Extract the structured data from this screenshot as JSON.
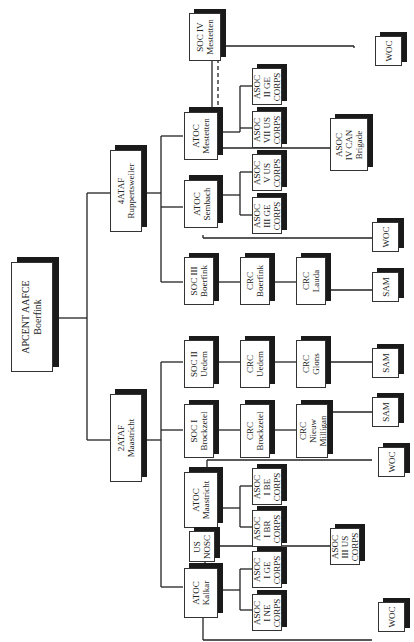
{
  "diagram": {
    "orientation": "rotated-90-ccw",
    "root": {
      "line1": "APCENT AAFCE",
      "line2": "Boerfink"
    },
    "branches": {
      "ataf4": {
        "line1": "4ATAF",
        "line2": "Ruppertsweiler"
      },
      "ataf2": {
        "line1": "2ATAF",
        "line2": "Maastricht"
      }
    },
    "nodes": {
      "soc_iv": {
        "line1": "SOC IV",
        "line2": "Mestetten"
      },
      "atoc_mestetten": {
        "line1": "ATOC",
        "line2": "Mestetten"
      },
      "asoc_ii_ge": {
        "line1": "ASOC",
        "line2": "II GE",
        "line3": "CORPS"
      },
      "asoc_vii_us": {
        "line1": "ASOC",
        "line2": "VII US",
        "line3": "CORPS"
      },
      "asoc_iv_can": {
        "line1": "ASOC",
        "line2": "IV CAN",
        "line3": "Brigade"
      },
      "woc_top": {
        "line1": "WOC"
      },
      "atoc_sembach": {
        "line1": "ATOC",
        "line2": "Sembach"
      },
      "asoc_v_us": {
        "line1": "ASOC",
        "line2": "V US",
        "line3": "CORPS"
      },
      "asoc_iii_ge": {
        "line1": "ASOC",
        "line2": "III GE",
        "line3": "CORPS"
      },
      "woc_sembach": {
        "line1": "WOC"
      },
      "soc_iii": {
        "line1": "SOC III",
        "line2": "Boerfink"
      },
      "crc_boerfink": {
        "line1": "CRC",
        "line2": "Boerfink"
      },
      "crc_lauda": {
        "line1": "CRC",
        "line2": "Lauda"
      },
      "sam_lauda": {
        "line1": "SAM"
      },
      "soc_ii": {
        "line1": "SOC II",
        "line2": "Uedem"
      },
      "crc_uedem": {
        "line1": "CRC",
        "line2": "Uedem"
      },
      "crc_glons": {
        "line1": "CRC",
        "line2": "Glons"
      },
      "sam_glons": {
        "line1": "SAM"
      },
      "soc_i": {
        "line1": "SOC I",
        "line2": "Brockzetel"
      },
      "crc_brockzetel": {
        "line1": "CRC",
        "line2": "Brockzetel"
      },
      "crc_nieuw_milligan": {
        "line1": "CRC",
        "line2": "Nieuw",
        "line3": "Milligan"
      },
      "sam_milligan": {
        "line1": "SAM"
      },
      "atoc_maastricht": {
        "line1": "ATOC",
        "line2": "Maastricht"
      },
      "asoc_i_be": {
        "line1": "ASOC",
        "line2": "I BE",
        "line3": "CORPS"
      },
      "asoc_i_br": {
        "line1": "ASOC",
        "line2": "I BR",
        "line3": "CORPS"
      },
      "woc_maastricht": {
        "line1": "WOC"
      },
      "us_nosc": {
        "line1": "US",
        "line2": "NOSC"
      },
      "asoc_iii_us": {
        "line1": "ASOC",
        "line2": "III US",
        "line3": "CORPS"
      },
      "atoc_kalkar": {
        "line1": "ATOC",
        "line2": "Kalkar"
      },
      "asoc_i_ge": {
        "line1": "ASOC",
        "line2": "I GE",
        "line3": "CORPS"
      },
      "asoc_i_ne": {
        "line1": "ASOC",
        "line2": "I NE",
        "line3": "CORPS"
      },
      "woc_kalkar": {
        "line1": "WOC"
      }
    },
    "colors": {
      "line": "#222222",
      "shadow": "#1a1a1a",
      "box_bg": "#ffffff",
      "text": "#222222"
    }
  }
}
